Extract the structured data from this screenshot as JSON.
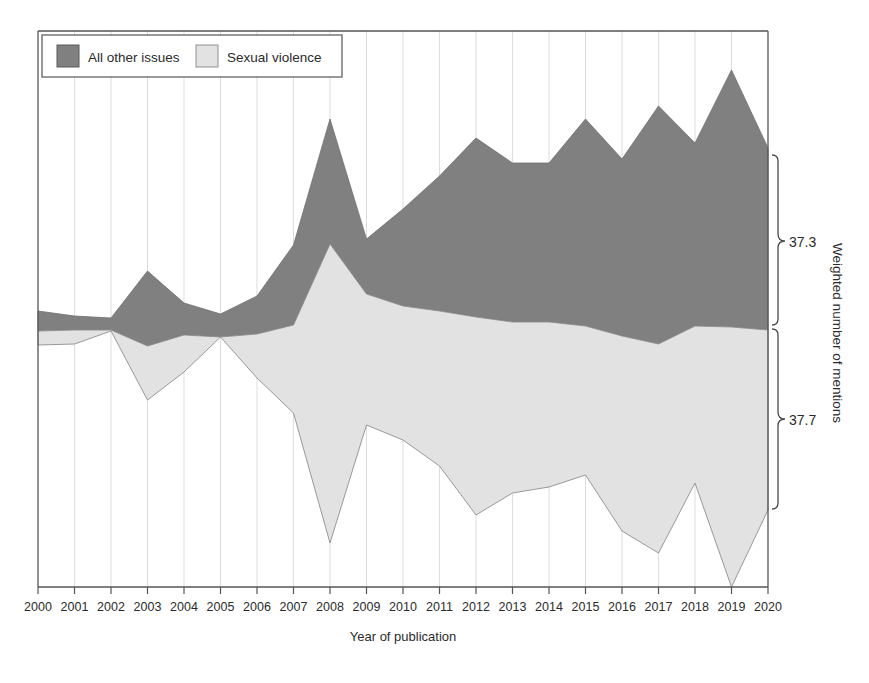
{
  "figure": {
    "background": "#ffffff",
    "frame_color": "#555555"
  },
  "legend": {
    "items": [
      {
        "label": "All other issues",
        "color": "#808080"
      },
      {
        "label": "Sexual violence",
        "color": "#e2e2e2"
      }
    ]
  },
  "axes": {
    "x_title": "Year of publication",
    "y_title": "Weighted number of mentions"
  },
  "annotations": {
    "upper_brace_label": "37.3",
    "lower_brace_label": "37.7"
  },
  "chart_data": {
    "type": "area",
    "title": "",
    "subtitle": "",
    "xlabel": "Year of publication",
    "ylabel": "Weighted number of mentions",
    "grid": true,
    "grid_axis": "x",
    "legend_position": "top-left",
    "stacked": true,
    "annotations": [
      {
        "text": "37.3",
        "target": "All other issues",
        "type": "brace",
        "side": "right"
      },
      {
        "text": "37.7",
        "target": "Sexual violence",
        "type": "brace",
        "side": "right"
      }
    ],
    "categories": [
      "2000",
      "2001",
      "2002",
      "2003",
      "2004",
      "2005",
      "2006",
      "2007",
      "2008",
      "2009",
      "2010",
      "2011",
      "2012",
      "2013",
      "2014",
      "2015",
      "2016",
      "2017",
      "2018",
      "2019",
      "2020"
    ],
    "x": [
      2000,
      2001,
      2002,
      2003,
      2004,
      2005,
      2006,
      2007,
      2008,
      2009,
      2010,
      2011,
      2012,
      2013,
      2014,
      2015,
      2016,
      2017,
      2018,
      2019,
      2020
    ],
    "axis_pixel_reference": {
      "note": "boundaries recorded as screen y-pixels read off the image; smaller y = higher value",
      "x_left_px": 38,
      "x_right_px": 768,
      "y_baseline_px": 587,
      "y_top_px": 31
    },
    "boundaries_px": {
      "top_of_dark": [
        311,
        316,
        318,
        271,
        303,
        314,
        296,
        245,
        119,
        239,
        209,
        176,
        138,
        163,
        163,
        119,
        159,
        106,
        143,
        70,
        148
      ],
      "dark_light_divide": [
        331,
        330,
        330,
        346,
        335,
        337,
        334,
        325,
        244,
        294,
        306,
        311,
        317,
        322,
        322,
        326,
        336,
        344,
        326,
        327,
        330
      ],
      "bottom_of_light": [
        345,
        344,
        331,
        400,
        372,
        337,
        378,
        413,
        543,
        425,
        440,
        466,
        515,
        493,
        487,
        475,
        531,
        553,
        483,
        587,
        510
      ]
    },
    "series": [
      {
        "name": "All other issues",
        "color": "#808080",
        "note": "dark upper band thickness (divide minus top), in pixels",
        "values": [
          20,
          14,
          12,
          75,
          32,
          23,
          38,
          80,
          125,
          55,
          97,
          135,
          179,
          159,
          159,
          207,
          177,
          238,
          183,
          257,
          182
        ]
      },
      {
        "name": "Sexual violence",
        "color": "#e2e2e2",
        "note": "light lower band thickness (bottom minus divide), in pixels",
        "values": [
          14,
          14,
          1,
          54,
          37,
          0,
          44,
          88,
          299,
          131,
          134,
          155,
          198,
          171,
          165,
          149,
          195,
          209,
          157,
          260,
          180
        ]
      }
    ]
  }
}
